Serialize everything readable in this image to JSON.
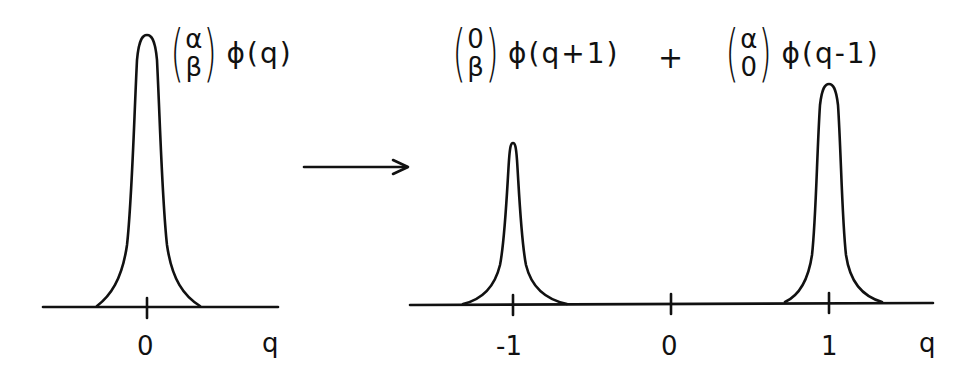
{
  "diagram": {
    "left_panel": {
      "axis_label": "q",
      "tick_label": "0",
      "expression": {
        "vector_top": "α",
        "vector_bottom": "β",
        "function": "ϕ(q)"
      }
    },
    "arrow": {
      "direction": "right"
    },
    "right_panel": {
      "axis_label": "q",
      "tick_labels": [
        "-1",
        "0",
        "1"
      ],
      "term1": {
        "vector_top": "0",
        "vector_bottom": "β",
        "function": "ϕ(q+1)"
      },
      "operator": "+",
      "term2": {
        "vector_top": "α",
        "vector_bottom": "0",
        "function": "ϕ(q-1)"
      }
    }
  },
  "colors": {
    "ink": "#111111",
    "background": "#ffffff"
  }
}
